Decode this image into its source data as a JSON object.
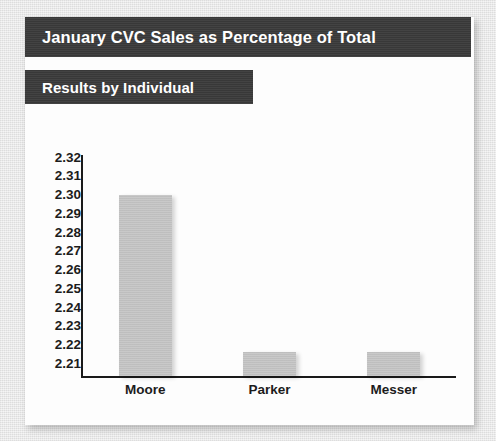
{
  "slide": {
    "title": "January CVC Sales as Percentage of Total",
    "subtitle": "Results by Individual"
  },
  "theme": {
    "heading_bar_color": "#3b3b3b",
    "heading_text_color": "#ffffff",
    "bar_fill_color": "#c2c2c2",
    "axis_color": "#1a1a1a",
    "card_color": "#fdfdfd",
    "page_background_color": "#eaeaea"
  },
  "chart_data": {
    "type": "bar",
    "title": "January CVC Sales as Percentage of Total",
    "subtitle": "Results by Individual",
    "categories": [
      "Moore",
      "Parker",
      "Messer"
    ],
    "values": [
      2.3,
      2.222,
      2.222
    ],
    "series": [
      {
        "name": "CVC Sales as Percentage of Total",
        "values": [
          2.3,
          2.222,
          2.222
        ]
      }
    ],
    "xlabel": "",
    "ylabel": "",
    "ylim": [
      2.21,
      2.32
    ],
    "ytick_step": 0.01,
    "yticks": [
      "2.32",
      "2.31",
      "2.30",
      "2.29",
      "2.28",
      "2.27",
      "2.26",
      "2.25",
      "2.24",
      "2.23",
      "2.22",
      "2.21"
    ],
    "grid": false,
    "legend": false,
    "legend_position": "none"
  }
}
